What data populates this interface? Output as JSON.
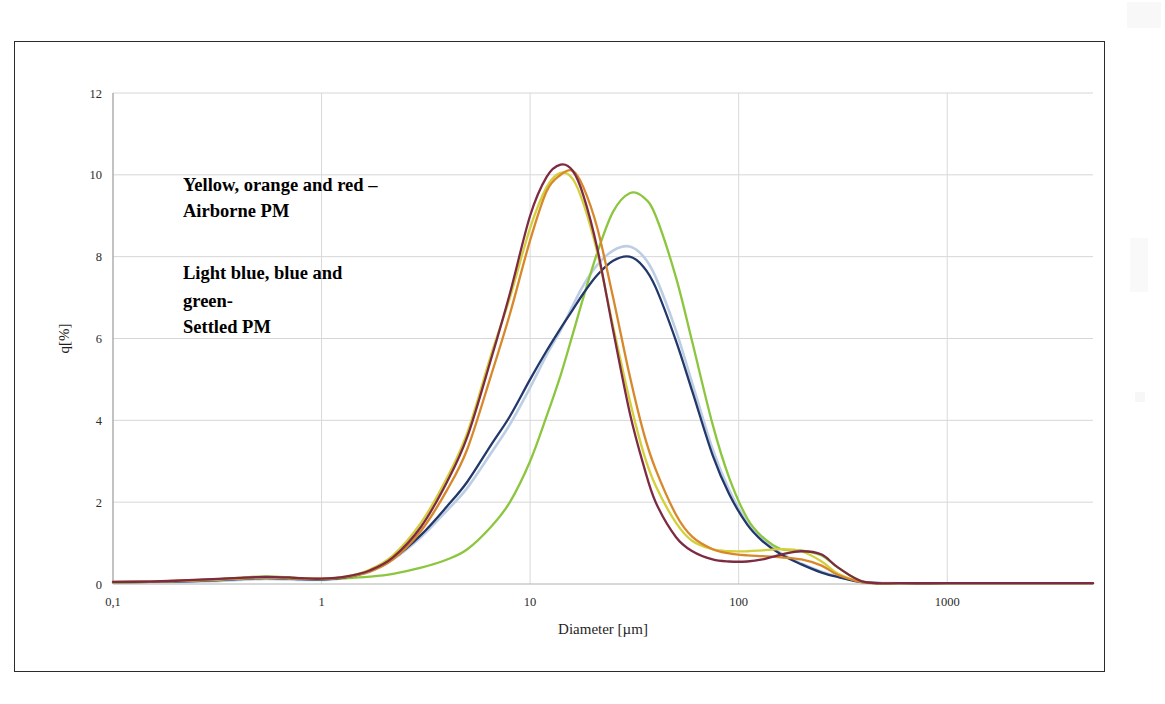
{
  "figure": {
    "border_color": "#2b2b2b",
    "background": "#ffffff"
  },
  "annotations": {
    "airborne": {
      "line1": "Yellow, orange and red –",
      "line2": "Airborne PM"
    },
    "settled": {
      "line1": "Light blue, blue and",
      "line2": "green-",
      "line3": "Settled PM"
    }
  },
  "chart_data": {
    "type": "line",
    "title": "",
    "xlabel": "Diameter [µm]",
    "ylabel": "q[%]",
    "xscale": "log",
    "xlim": [
      0.1,
      5000
    ],
    "ylim": [
      0,
      12
    ],
    "yticks": [
      0,
      2,
      4,
      6,
      8,
      10,
      12
    ],
    "ytick_labels": [
      "0",
      "2",
      "4",
      "6",
      "8",
      "10",
      "12"
    ],
    "xticks": [
      0.1,
      1,
      10,
      100,
      1000
    ],
    "xtick_labels": [
      "0,1",
      "1",
      "10",
      "100",
      "1000"
    ],
    "grid": "both",
    "legend": "none",
    "legend_position": "in-plot-text-annotation",
    "group_labels": {
      "airborne": [
        "yellow",
        "orange",
        "red"
      ],
      "settled": [
        "light blue",
        "blue",
        "green"
      ]
    },
    "colors": {
      "yellow": "#d4cf3a",
      "orange": "#d8872a",
      "red": "#7d2b43",
      "light_blue": "#b9cbe3",
      "blue": "#22386b",
      "green": "#8cc63f"
    },
    "peaks": {
      "yellow": {
        "x": 14,
        "y": 10.05
      },
      "orange": {
        "x": 16,
        "y": 10.1
      },
      "red": {
        "x": 15,
        "y": 10.25
      },
      "light_blue": {
        "x": 30,
        "y": 8.25
      },
      "blue": {
        "x": 31,
        "y": 8.0
      },
      "green": {
        "x": 32,
        "y": 9.55
      }
    },
    "x": [
      0.1,
      0.15,
      0.2,
      0.3,
      0.4,
      0.5,
      0.6,
      0.7,
      0.8,
      1.0,
      1.3,
      1.7,
      2.2,
      3.0,
      4.0,
      5.0,
      6.5,
      8.0,
      10.0,
      12.0,
      14.0,
      16.0,
      18.0,
      21.0,
      25.0,
      30.0,
      35.0,
      40.0,
      50.0,
      60.0,
      75.0,
      90.0,
      110.0,
      130.0,
      160.0,
      200.0,
      250.0,
      300.0,
      400.0,
      600.0,
      1000.0,
      2000.0,
      5000.0
    ],
    "series": [
      {
        "name": "Airborne PM - yellow",
        "color": "#d4cf3a",
        "values": [
          0.04,
          0.05,
          0.07,
          0.1,
          0.13,
          0.15,
          0.15,
          0.14,
          0.13,
          0.12,
          0.18,
          0.35,
          0.7,
          1.5,
          2.6,
          3.7,
          5.6,
          7.0,
          8.7,
          9.7,
          10.05,
          9.9,
          9.3,
          8.1,
          6.3,
          4.5,
          3.2,
          2.4,
          1.5,
          1.05,
          0.85,
          0.8,
          0.8,
          0.82,
          0.85,
          0.8,
          0.55,
          0.25,
          0.04,
          0.02,
          0.02,
          0.02,
          0.02
        ]
      },
      {
        "name": "Airborne PM - orange",
        "color": "#d8872a",
        "values": [
          0.05,
          0.06,
          0.08,
          0.11,
          0.14,
          0.16,
          0.16,
          0.15,
          0.14,
          0.13,
          0.17,
          0.3,
          0.6,
          1.3,
          2.3,
          3.3,
          5.1,
          6.6,
          8.4,
          9.6,
          10.0,
          10.1,
          9.7,
          8.7,
          7.0,
          5.1,
          3.7,
          2.8,
          1.7,
          1.15,
          0.85,
          0.75,
          0.7,
          0.68,
          0.65,
          0.6,
          0.45,
          0.22,
          0.04,
          0.02,
          0.02,
          0.02,
          0.02
        ]
      },
      {
        "name": "Airborne PM - red",
        "color": "#7d2b43",
        "values": [
          0.05,
          0.06,
          0.08,
          0.12,
          0.15,
          0.17,
          0.17,
          0.16,
          0.14,
          0.13,
          0.18,
          0.33,
          0.65,
          1.4,
          2.5,
          3.6,
          5.5,
          7.1,
          9.0,
          9.95,
          10.25,
          10.1,
          9.5,
          8.2,
          6.2,
          4.2,
          2.9,
          2.0,
          1.15,
          0.8,
          0.6,
          0.55,
          0.55,
          0.6,
          0.72,
          0.8,
          0.72,
          0.4,
          0.05,
          0.02,
          0.02,
          0.02,
          0.02
        ]
      },
      {
        "name": "Settled PM - light blue",
        "color": "#b9cbe3",
        "values": [
          0.03,
          0.04,
          0.05,
          0.07,
          0.1,
          0.12,
          0.12,
          0.11,
          0.1,
          0.1,
          0.15,
          0.3,
          0.6,
          1.15,
          1.8,
          2.35,
          3.2,
          3.9,
          4.8,
          5.6,
          6.2,
          6.8,
          7.3,
          7.8,
          8.15,
          8.25,
          8.0,
          7.5,
          6.2,
          4.9,
          3.3,
          2.3,
          1.5,
          1.1,
          0.75,
          0.5,
          0.3,
          0.18,
          0.04,
          0.02,
          0.02,
          0.02,
          0.02
        ]
      },
      {
        "name": "Settled PM - blue",
        "color": "#22386b",
        "values": [
          0.04,
          0.05,
          0.06,
          0.09,
          0.12,
          0.14,
          0.14,
          0.13,
          0.12,
          0.11,
          0.16,
          0.32,
          0.62,
          1.2,
          1.9,
          2.5,
          3.4,
          4.1,
          5.0,
          5.7,
          6.25,
          6.7,
          7.1,
          7.55,
          7.9,
          8.0,
          7.75,
          7.25,
          5.95,
          4.7,
          3.15,
          2.2,
          1.45,
          1.05,
          0.72,
          0.48,
          0.28,
          0.17,
          0.04,
          0.02,
          0.02,
          0.02,
          0.02
        ]
      },
      {
        "name": "Settled PM - green",
        "color": "#8cc63f",
        "values": [
          0.04,
          0.05,
          0.07,
          0.11,
          0.15,
          0.18,
          0.18,
          0.16,
          0.14,
          0.12,
          0.14,
          0.18,
          0.25,
          0.4,
          0.6,
          0.85,
          1.4,
          2.0,
          3.0,
          4.1,
          5.1,
          6.1,
          7.0,
          8.1,
          9.1,
          9.55,
          9.45,
          9.0,
          7.5,
          5.9,
          3.9,
          2.6,
          1.6,
          1.15,
          0.85,
          0.82,
          0.7,
          0.4,
          0.05,
          0.02,
          0.02,
          0.02,
          0.02
        ]
      }
    ]
  }
}
